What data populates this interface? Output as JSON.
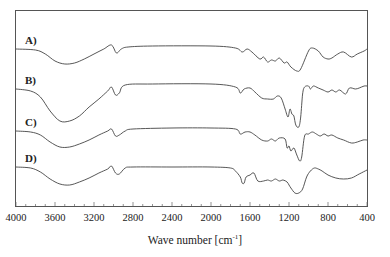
{
  "chart_data": {
    "type": "line",
    "title": "",
    "xlabel": "Wave number [cm-1]",
    "xlabel_parts": {
      "main": "Wave number [cm",
      "sup": "-1",
      "close": "]"
    },
    "ylabel": "",
    "xlim": [
      4000,
      400
    ],
    "x_reversed": true,
    "grid": false,
    "legend": "inline labels at left of each trace",
    "x_ticks": [
      4000,
      3600,
      3200,
      2800,
      2400,
      2000,
      1600,
      1200,
      800,
      400
    ],
    "y_ticks": [],
    "series": [
      {
        "name": "A)",
        "offset_px": 49,
        "points": [
          [
            4000,
            0
          ],
          [
            3800,
            1
          ],
          [
            3700,
            5
          ],
          [
            3600,
            12
          ],
          [
            3500,
            15
          ],
          [
            3400,
            14
          ],
          [
            3300,
            10
          ],
          [
            3200,
            5
          ],
          [
            3100,
            0
          ],
          [
            3020,
            -4
          ],
          [
            2970,
            4
          ],
          [
            2920,
            0
          ],
          [
            2850,
            -2
          ],
          [
            2600,
            -3
          ],
          [
            2000,
            -3
          ],
          [
            1750,
            -1
          ],
          [
            1680,
            3
          ],
          [
            1630,
            0
          ],
          [
            1580,
            3
          ],
          [
            1500,
            10
          ],
          [
            1460,
            8
          ],
          [
            1420,
            13
          ],
          [
            1380,
            11
          ],
          [
            1340,
            12
          ],
          [
            1300,
            9
          ],
          [
            1250,
            14
          ],
          [
            1220,
            13
          ],
          [
            1180,
            18
          ],
          [
            1120,
            22
          ],
          [
            1080,
            20
          ],
          [
            1000,
            2
          ],
          [
            960,
            -1
          ],
          [
            900,
            2
          ],
          [
            850,
            8
          ],
          [
            800,
            10
          ],
          [
            760,
            9
          ],
          [
            700,
            5
          ],
          [
            640,
            3
          ],
          [
            560,
            8
          ],
          [
            500,
            5
          ],
          [
            430,
            2
          ],
          [
            400,
            0
          ]
        ]
      },
      {
        "name": "B)",
        "offset_px": 89,
        "points": [
          [
            4000,
            0
          ],
          [
            3850,
            2
          ],
          [
            3750,
            8
          ],
          [
            3650,
            22
          ],
          [
            3550,
            32
          ],
          [
            3450,
            32
          ],
          [
            3350,
            27
          ],
          [
            3250,
            18
          ],
          [
            3150,
            10
          ],
          [
            3060,
            2
          ],
          [
            3020,
            -2
          ],
          [
            2980,
            6
          ],
          [
            2940,
            4
          ],
          [
            2880,
            -4
          ],
          [
            2600,
            -5
          ],
          [
            2000,
            -5
          ],
          [
            1750,
            -2
          ],
          [
            1700,
            4
          ],
          [
            1660,
            0
          ],
          [
            1600,
            -1
          ],
          [
            1550,
            3
          ],
          [
            1480,
            9
          ],
          [
            1420,
            10
          ],
          [
            1360,
            10
          ],
          [
            1320,
            7
          ],
          [
            1280,
            9
          ],
          [
            1240,
            20
          ],
          [
            1210,
            28
          ],
          [
            1190,
            20
          ],
          [
            1170,
            25
          ],
          [
            1150,
            27
          ],
          [
            1130,
            36
          ],
          [
            1100,
            38
          ],
          [
            1080,
            28
          ],
          [
            1060,
            5
          ],
          [
            1040,
            -2
          ],
          [
            1000,
            -3
          ],
          [
            980,
            0
          ],
          [
            950,
            -3
          ],
          [
            900,
            -1
          ],
          [
            850,
            1
          ],
          [
            800,
            3
          ],
          [
            760,
            1
          ],
          [
            720,
            3
          ],
          [
            680,
            1
          ],
          [
            620,
            5
          ],
          [
            580,
            -1
          ],
          [
            520,
            0
          ],
          [
            480,
            -1
          ],
          [
            430,
            -3
          ],
          [
            400,
            -3
          ]
        ]
      },
      {
        "name": "C)",
        "offset_px": 131,
        "points": [
          [
            4000,
            0
          ],
          [
            3850,
            1
          ],
          [
            3750,
            4
          ],
          [
            3650,
            11
          ],
          [
            3550,
            16
          ],
          [
            3450,
            16
          ],
          [
            3350,
            13
          ],
          [
            3250,
            9
          ],
          [
            3150,
            4
          ],
          [
            3060,
            0
          ],
          [
            3020,
            -2
          ],
          [
            2980,
            5
          ],
          [
            2940,
            4
          ],
          [
            2880,
            0
          ],
          [
            2800,
            -2
          ],
          [
            2400,
            -3
          ],
          [
            2000,
            -3
          ],
          [
            1750,
            -2
          ],
          [
            1700,
            3
          ],
          [
            1650,
            1
          ],
          [
            1600,
            1
          ],
          [
            1550,
            4
          ],
          [
            1480,
            9
          ],
          [
            1420,
            10
          ],
          [
            1380,
            8
          ],
          [
            1340,
            10
          ],
          [
            1300,
            7
          ],
          [
            1240,
            8
          ],
          [
            1220,
            17
          ],
          [
            1200,
            15
          ],
          [
            1180,
            20
          ],
          [
            1150,
            17
          ],
          [
            1120,
            24
          ],
          [
            1090,
            30
          ],
          [
            1070,
            26
          ],
          [
            1040,
            5
          ],
          [
            1000,
            3
          ],
          [
            960,
            1
          ],
          [
            920,
            3
          ],
          [
            880,
            5
          ],
          [
            840,
            3
          ],
          [
            800,
            5
          ],
          [
            760,
            4
          ],
          [
            700,
            7
          ],
          [
            640,
            9
          ],
          [
            560,
            12
          ],
          [
            500,
            11
          ],
          [
            440,
            9
          ],
          [
            400,
            9
          ]
        ]
      },
      {
        "name": "D)",
        "offset_px": 167,
        "points": [
          [
            4000,
            0
          ],
          [
            3850,
            1
          ],
          [
            3750,
            5
          ],
          [
            3650,
            12
          ],
          [
            3550,
            17
          ],
          [
            3450,
            18
          ],
          [
            3350,
            15
          ],
          [
            3250,
            11
          ],
          [
            3150,
            6
          ],
          [
            3060,
            2
          ],
          [
            3020,
            -1
          ],
          [
            2980,
            6
          ],
          [
            2940,
            7
          ],
          [
            2880,
            1
          ],
          [
            2800,
            0
          ],
          [
            2400,
            0
          ],
          [
            2000,
            0
          ],
          [
            1800,
            1
          ],
          [
            1750,
            4
          ],
          [
            1700,
            10
          ],
          [
            1680,
            16
          ],
          [
            1660,
            16
          ],
          [
            1640,
            10
          ],
          [
            1600,
            8
          ],
          [
            1560,
            6
          ],
          [
            1520,
            14
          ],
          [
            1460,
            14
          ],
          [
            1420,
            13
          ],
          [
            1380,
            14
          ],
          [
            1340,
            12
          ],
          [
            1300,
            14
          ],
          [
            1260,
            13
          ],
          [
            1220,
            15
          ],
          [
            1200,
            18
          ],
          [
            1180,
            21
          ],
          [
            1140,
            26
          ],
          [
            1100,
            26
          ],
          [
            1060,
            22
          ],
          [
            1020,
            10
          ],
          [
            980,
            4
          ],
          [
            940,
            1
          ],
          [
            900,
            2
          ],
          [
            860,
            4
          ],
          [
            800,
            8
          ],
          [
            720,
            11
          ],
          [
            640,
            12
          ],
          [
            560,
            11
          ],
          [
            480,
            7
          ],
          [
            400,
            3
          ]
        ]
      }
    ]
  },
  "labels": {
    "xlabel_main": "Wave number [cm",
    "xlabel_sup": "-1",
    "xlabel_close": "]"
  }
}
